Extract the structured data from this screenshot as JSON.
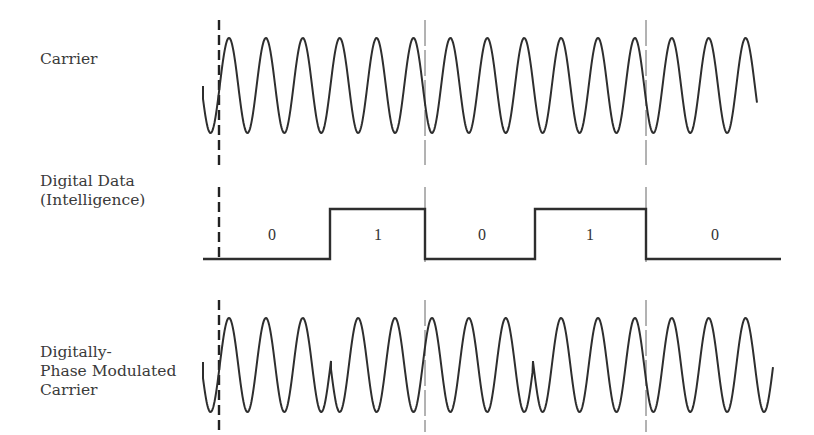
{
  "labels": {
    "carrier": "Carrier",
    "digital_line1": "Digital Data",
    "digital_line2": "(Intelligence)",
    "modulated_line1": "Digitally-",
    "modulated_line2": "Phase Modulated",
    "modulated_line3": "Carrier"
  },
  "bits": [
    {
      "value": "0",
      "x": 272
    },
    {
      "value": "1",
      "x": 378
    },
    {
      "value": "0",
      "x": 482
    },
    {
      "value": "1",
      "x": 590
    },
    {
      "value": "0",
      "x": 715
    }
  ],
  "colors": {
    "ink": "#2e2e2e",
    "text": "#3a3a3a",
    "background": "#ffffff"
  },
  "geometry": {
    "period_px": 36.9,
    "first_peak_x": 229,
    "carrier": {
      "x_start": 203,
      "x_end": 757,
      "y_top": 38,
      "y_bottom": 133
    },
    "modulated": {
      "x_start": 203,
      "x_end": 773,
      "y_top": 318,
      "y_bottom": 412,
      "phase_flip_x": [
        331,
        533
      ]
    },
    "digital": {
      "x_start": 203,
      "x_end": 781,
      "y_low": 259,
      "y_high": 209,
      "transitions_x": [
        330,
        425,
        535,
        646
      ],
      "levels": [
        0,
        1,
        0,
        1,
        0
      ]
    },
    "bit_boundaries": [
      {
        "x": 219,
        "style": "heavy-dash"
      },
      {
        "x": 425,
        "style": "light-dash"
      },
      {
        "x": 646,
        "style": "light-dash"
      }
    ]
  }
}
